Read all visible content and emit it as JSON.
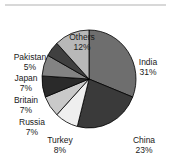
{
  "chart_data": {
    "type": "pie",
    "title": "",
    "subtitle": "",
    "xlabel": "",
    "ylabel": "",
    "legend_position": "outside-labels",
    "grid": false,
    "units": "percent",
    "start_angle_deg": 0,
    "direction": "clockwise",
    "categories": [
      "India",
      "China",
      "Turkey",
      "Russia",
      "Britain",
      "Japan",
      "Pakistan",
      "Others"
    ],
    "values": [
      31,
      23,
      8,
      7,
      7,
      7,
      5,
      12
    ],
    "labels": [
      {
        "name": "India",
        "pct": "31%",
        "value": 31,
        "color": "#6e6e6e",
        "side": "right"
      },
      {
        "name": "China",
        "pct": "23%",
        "value": 23,
        "color": "#3a3a3a",
        "side": "right"
      },
      {
        "name": "Turkey",
        "pct": "8%",
        "value": 8,
        "color": "#efefef",
        "side": "center"
      },
      {
        "name": "Russia",
        "pct": "7%",
        "value": 7,
        "color": "#c9c9c9",
        "side": "left"
      },
      {
        "name": "Britain",
        "pct": "7%",
        "value": 7,
        "color": "#2a2a2a",
        "side": "left"
      },
      {
        "name": "Japan",
        "pct": "7%",
        "value": 7,
        "color": "#838383",
        "side": "left"
      },
      {
        "name": "Pakistan",
        "pct": "5%",
        "value": 5,
        "color": "#404040",
        "side": "left"
      },
      {
        "name": "Others",
        "pct": "12%",
        "value": 12,
        "color": "#b8b8b8",
        "side": "center"
      }
    ],
    "colors": {
      "india": "#6e6e6e",
      "china": "#3a3a3a",
      "turkey": "#efefef",
      "russia": "#c9c9c9",
      "britain": "#2a2a2a",
      "japan": "#838383",
      "pakistan": "#404040",
      "others": "#b8b8b8",
      "outline": "#000000",
      "background": "#ffffff",
      "text": "#1a1a1a",
      "rule": "#d8d8d8"
    }
  },
  "labels": {
    "india": {
      "name": "India",
      "pct": "31%"
    },
    "china": {
      "name": "China",
      "pct": "23%"
    },
    "turkey": {
      "name": "Turkey",
      "pct": "8%"
    },
    "russia": {
      "name": "Russia",
      "pct": "7%"
    },
    "britain": {
      "name": "Britain",
      "pct": "7%"
    },
    "japan": {
      "name": "Japan",
      "pct": "7%"
    },
    "pakistan": {
      "name": "Pakistan",
      "pct": "5%"
    },
    "others": {
      "name": "Others",
      "pct": "12%"
    }
  }
}
